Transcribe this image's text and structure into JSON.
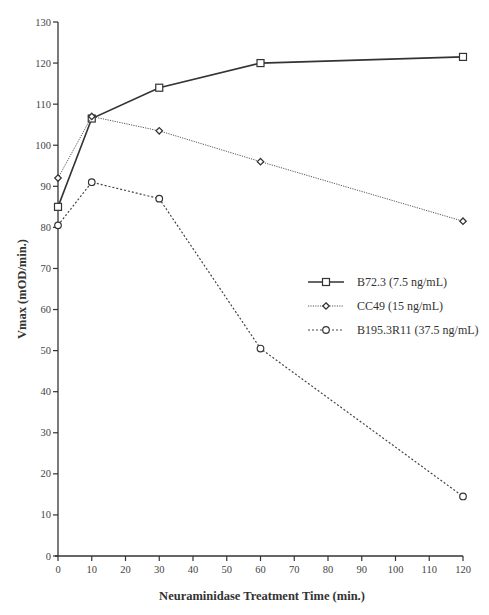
{
  "chart_data": {
    "type": "line",
    "title": "",
    "xlabel": "Neuraminidase Treatment Time (min.)",
    "ylabel": "Vmax  (mOD/min.)",
    "xlim": [
      0,
      120
    ],
    "ylim": [
      0,
      130
    ],
    "x_ticks": [
      0,
      10,
      20,
      30,
      40,
      50,
      60,
      70,
      80,
      90,
      100,
      110,
      120
    ],
    "y_ticks": [
      0,
      10,
      20,
      30,
      40,
      50,
      60,
      70,
      80,
      90,
      100,
      110,
      120,
      130
    ],
    "grid": false,
    "legend_position": "right-center",
    "x": [
      0,
      10,
      30,
      60,
      120
    ],
    "series": [
      {
        "name": "B72.3 (7.5 ng/mL)",
        "marker": "square",
        "line": "solid",
        "values": [
          85,
          106.5,
          114,
          120,
          121.5
        ]
      },
      {
        "name": "CC49 (15 ng/mL)",
        "marker": "diamond",
        "line": "dotted",
        "values": [
          92,
          107,
          103.5,
          96,
          81.5
        ]
      },
      {
        "name": "B195.3R11 (37.5 ng/mL)",
        "marker": "circle",
        "line": "dashed",
        "values": [
          80.5,
          91,
          87,
          50.5,
          14.5
        ]
      }
    ]
  }
}
